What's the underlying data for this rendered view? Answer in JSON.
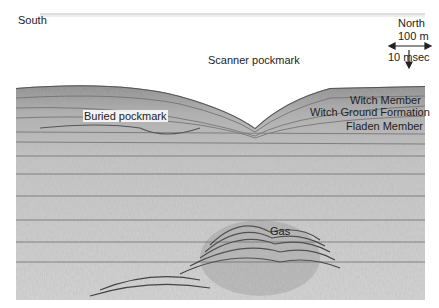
{
  "figure": {
    "type": "seismic-profile",
    "orientation": {
      "left": "South",
      "right": "North"
    },
    "scale_bar": {
      "horizontal": "100 m",
      "vertical": "10 msec"
    },
    "labels": {
      "south": "South",
      "north": "North",
      "scale_h": "100 m",
      "scale_v": "10 msec",
      "scanner_pockmark": "Scanner pockmark",
      "buried_pockmark": "Buried pockmark",
      "witch_member": "Witch Member",
      "witch_ground_formation": "Witch Ground Formation",
      "fladen_member": "Fladen Member",
      "gas": "Gas"
    },
    "colors": {
      "background": "#ffffff",
      "sediment_dark": "#6e6e6e",
      "sediment_mid": "#9a9a9a",
      "sediment_light": "#c8c8c8",
      "text": "#222222"
    }
  }
}
